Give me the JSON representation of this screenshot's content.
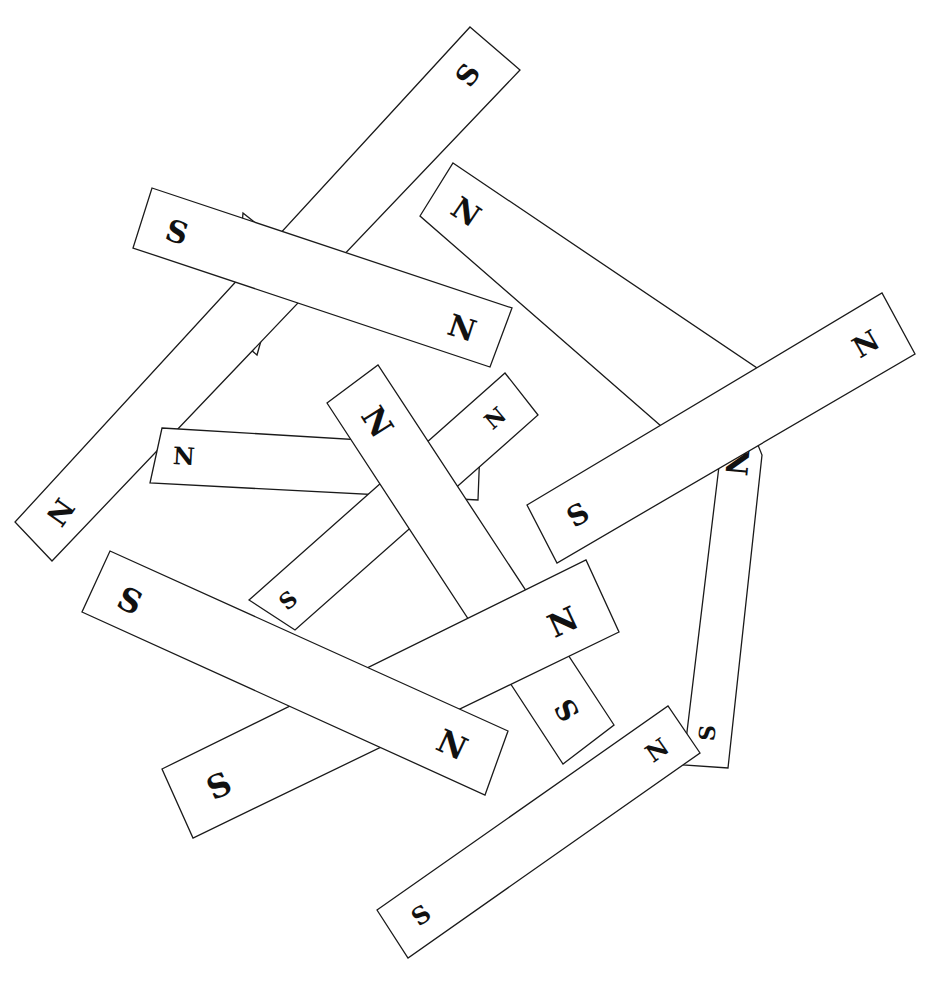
{
  "diagram": {
    "title": "",
    "colors": {
      "background": "#ffffff",
      "outline": "#1a1a1a",
      "label": "#111111"
    },
    "magnets": [
      {
        "id": "m1",
        "points": "730,375 762,455 728,768 683,765",
        "poles": [
          {
            "label": "N",
            "x": 737,
            "y": 462,
            "size": 30,
            "rotate": 95
          },
          {
            "label": "S",
            "x": 707,
            "y": 733,
            "size": 22,
            "rotate": -85
          }
        ]
      },
      {
        "id": "m2",
        "points": "453,163 760,370 700,460 420,216",
        "poles": [
          {
            "label": "N",
            "x": 466,
            "y": 212,
            "size": 30,
            "rotate": 34
          }
        ]
      },
      {
        "id": "m3",
        "points": "243,213 287,248 257,355 233,335",
        "poles": [
          {
            "label": "N",
            "x": 260,
            "y": 305,
            "size": 26,
            "rotate": 120
          }
        ]
      },
      {
        "id": "m4",
        "points": "470,27 520,70 52,561 15,522",
        "poles": [
          {
            "label": "S",
            "x": 468,
            "y": 75,
            "size": 28,
            "rotate": -55
          },
          {
            "label": "N",
            "x": 60,
            "y": 512,
            "size": 28,
            "rotate": 125
          }
        ]
      },
      {
        "id": "m5",
        "points": "152,188 512,308 490,367 133,248",
        "poles": [
          {
            "label": "S",
            "x": 177,
            "y": 232,
            "size": 30,
            "rotate": 18
          },
          {
            "label": "N",
            "x": 462,
            "y": 328,
            "size": 30,
            "rotate": 18
          }
        ]
      },
      {
        "id": "m6",
        "points": "162,428 480,447 478,500 150,483",
        "poles": [
          {
            "label": "N",
            "x": 184,
            "y": 456,
            "size": 24,
            "rotate": 3
          }
        ]
      },
      {
        "id": "m7",
        "points": "249,600 505,373 538,415 295,630",
        "poles": [
          {
            "label": "S",
            "x": 288,
            "y": 600,
            "size": 22,
            "rotate": -40
          },
          {
            "label": "N",
            "x": 495,
            "y": 418,
            "size": 22,
            "rotate": -40
          }
        ]
      },
      {
        "id": "m8",
        "points": "327,403 378,365 614,725 563,764",
        "poles": [
          {
            "label": "N",
            "x": 377,
            "y": 422,
            "size": 32,
            "rotate": 58
          },
          {
            "label": "S",
            "x": 567,
            "y": 710,
            "size": 28,
            "rotate": -122
          }
        ]
      },
      {
        "id": "m9",
        "points": "527,505 882,293 915,354 557,563",
        "poles": [
          {
            "label": "S",
            "x": 578,
            "y": 515,
            "size": 28,
            "rotate": -30
          },
          {
            "label": "N",
            "x": 866,
            "y": 344,
            "size": 28,
            "rotate": -30
          }
        ]
      },
      {
        "id": "m10",
        "points": "162,769 586,560 619,632 193,838",
        "poles": [
          {
            "label": "S",
            "x": 219,
            "y": 786,
            "size": 32,
            "rotate": -25
          },
          {
            "label": "N",
            "x": 563,
            "y": 622,
            "size": 32,
            "rotate": -25
          }
        ]
      },
      {
        "id": "m11",
        "points": "110,551 508,731 485,795 82,612",
        "poles": [
          {
            "label": "S",
            "x": 130,
            "y": 601,
            "size": 32,
            "rotate": 25
          },
          {
            "label": "N",
            "x": 452,
            "y": 745,
            "size": 32,
            "rotate": 25
          }
        ]
      },
      {
        "id": "m12",
        "points": "377,910 668,706 700,753 408,958",
        "poles": [
          {
            "label": "S",
            "x": 421,
            "y": 915,
            "size": 24,
            "rotate": -35
          },
          {
            "label": "N",
            "x": 657,
            "y": 750,
            "size": 24,
            "rotate": -35
          }
        ]
      }
    ]
  }
}
